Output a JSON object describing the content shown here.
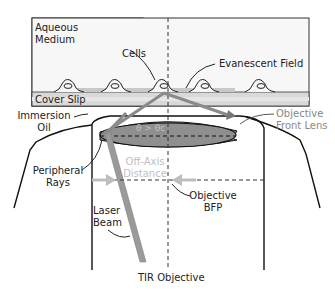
{
  "diagram": {
    "labels": {
      "aqueous_medium": [
        "Aqueous",
        "Medium"
      ],
      "cells": "Cells",
      "evanescent_field": "Evanescent Field",
      "cover_slip": "Cover Slip",
      "immersion_oil": [
        "Immersion",
        "Oil"
      ],
      "objective_front_lens": [
        "Objective",
        "Front Lens"
      ],
      "angle_condition": "θ > θc",
      "peripheral_rays": [
        "Peripheral",
        "Rays"
      ],
      "off_axis_distance": [
        "Off-Axis",
        "Distance"
      ],
      "objective_bfp": [
        "Objective",
        "BFP"
      ],
      "laser_beam": [
        "Laser",
        "Beam"
      ],
      "tir_objective": "TIR Objective"
    },
    "colors": {
      "line": "#1a1a1a",
      "lens_fill": "#8c8c8c",
      "beam_fill": "#9a9a9a",
      "cover_slip_fill": "#d9d9d9",
      "medium_fill": "#f6f6f6",
      "arrow_gray": "#bdbdbd",
      "label_gray": "#888888"
    }
  }
}
